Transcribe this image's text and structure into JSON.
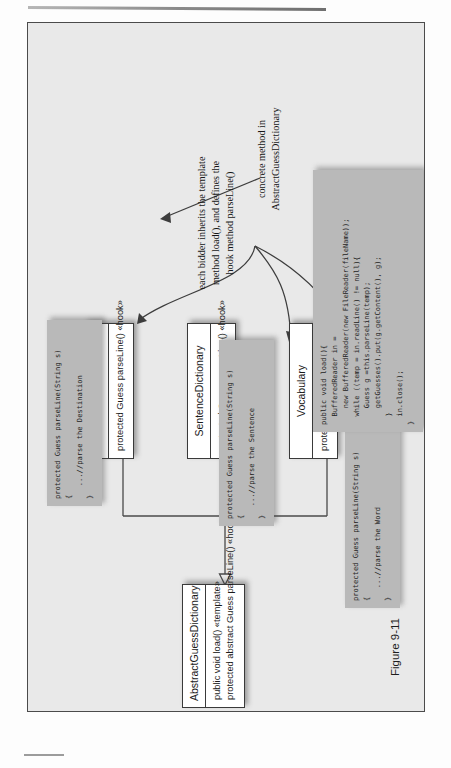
{
  "figure": {
    "caption": "Figure 9-11"
  },
  "diagram": {
    "type": "uml-class-diagram",
    "classes": [
      {
        "id": "abstract-guess-dictionary",
        "name": "AbstractGuessDictionary",
        "members": [
          "public void load() «template»",
          "protected abstract Guess parseLine() «hook»"
        ]
      },
      {
        "id": "address-book",
        "name": "AddressBook",
        "members": [
          "protected Guess parseLine() «hook»"
        ]
      },
      {
        "id": "sentence-dictionary",
        "name": "SentenceDictionary",
        "members": [
          "protected Guess parseLine() «hook»"
        ]
      },
      {
        "id": "vocabulary",
        "name": "Vocabulary",
        "members": [
          "protected Guess parseLine() «hook»"
        ]
      }
    ],
    "code_notes": [
      {
        "id": "address-book-code",
        "code": "protected Guess parseLine(String s)\n{\n   ...//parse the Destination\n}"
      },
      {
        "id": "sentence-dictionary-code",
        "code": "protected Guess parseLine(String s)\n{\n   ...//parse the Sentence\n}"
      },
      {
        "id": "vocabulary-code",
        "code": "protected Guess parseLine(String s)\n{\n   ...//parse the Word\n}"
      },
      {
        "id": "load-method-code",
        "code": "public void load(){\n  BufferedReader in =\n    new BufferedReader(new FileReader(fileName));\n  while ((temp = in.readLine() != null){\n    Guess g =this.parseLine(temp);\n    getGuesses().put(g.getContent(), g);\n  }\n  in.close();\n}"
      }
    ],
    "annotations": [
      {
        "id": "hook-annotation",
        "text": "each bidder inherits the template\nmethod load(), and defines the\nhook method parseLine()"
      },
      {
        "id": "concrete-annotation",
        "text": "concrete method in\nAbstractGuessDictionary"
      }
    ],
    "colors": {
      "frame_background": "#e9e9e9",
      "class_fill": "#ffffff",
      "class_border": "#3a3a3a",
      "code_note_fill": "#b9b9b9",
      "connector": "#4a4a4a",
      "text": "#1b1b1b"
    }
  }
}
